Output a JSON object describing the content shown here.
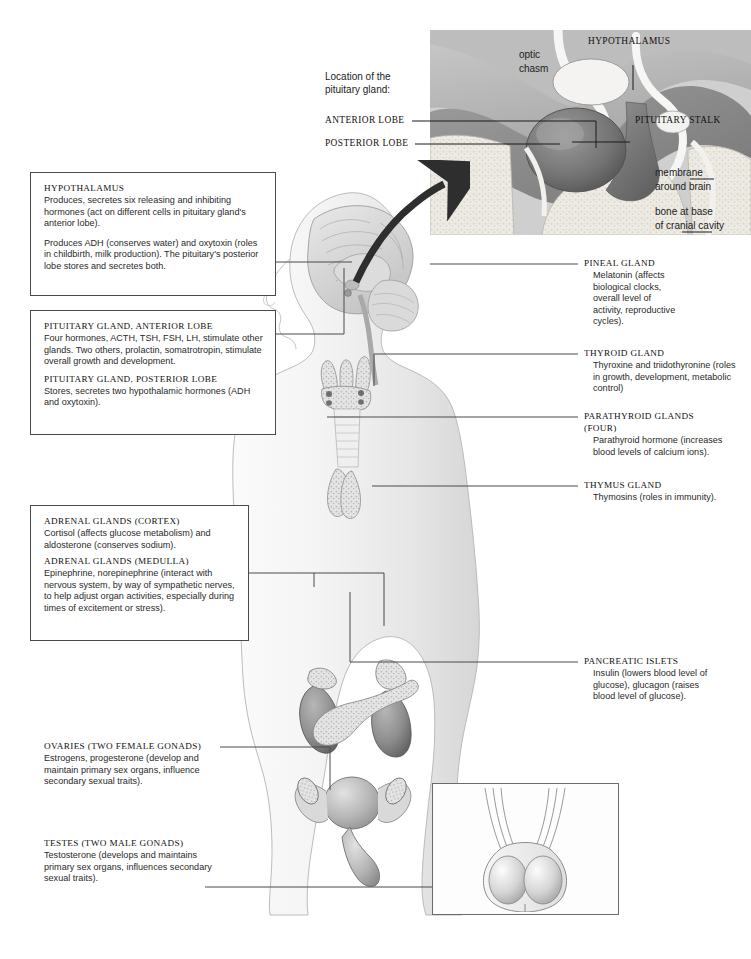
{
  "figure": {
    "background": "#ffffff",
    "line_color": "#4a4a4a"
  },
  "inset_pituitary": {
    "intro": "Location of the",
    "intro2": "pituitary gland:",
    "labels": {
      "anterior_lobe": "ANTERIOR LOBE",
      "posterior_lobe": "POSTERIOR LOBE",
      "hypothalamus": "HYPOTHALAMUS",
      "pituitary_stalk": "PITUITARY STALK",
      "optic_chasm_line1": "optic",
      "optic_chasm_line2": "chasm",
      "membrane_line1": "membrane",
      "membrane_line2": "around brain",
      "bone_line1": "bone at base",
      "bone_line2": "of cranial cavity"
    }
  },
  "callouts": {
    "hypothalamus": {
      "heading": "HYPOTHALAMUS",
      "para1": "Produces, secretes six releasing and inhibiting hormones (act on different cells in pituitary gland's anterior lobe).",
      "para2": "Produces ADH (conserves water) and oxytoxin (roles in childbirth, milk production). The pituitary's posterior lobe stores and secretes both."
    },
    "pituitary": {
      "heading_anterior": "PITUITARY GLAND, ANTERIOR LOBE",
      "para_anterior": "Four hormones, ACTH, TSH, FSH, LH, stimulate other glands. Two others, prolactin, somatrotropin, stimulate overall growth and development.",
      "heading_posterior": "PITUITARY GLAND, POSTERIOR LOBE",
      "para_posterior": "Stores, secretes two hypothalamic hormones (ADH and oxytoxin)."
    },
    "adrenal": {
      "heading_cortex": "ADRENAL GLANDS (CORTEX)",
      "para_cortex": "Cortisol (affects glucose metabolism) and aldosterone (conserves sodium).",
      "heading_medulla": "ADRENAL GLANDS (MEDULLA)",
      "para_medulla": "Epinephrine, norepinephrine (interact with nervous system, by way of sympathetic nerves, to help adjust organ activities, especially during times of excitement or stress)."
    },
    "ovaries": {
      "heading": "OVARIES (TWO FEMALE GONADS)",
      "para": "Estrogens, progesterone (develop and maintain primary sex organs, influence secondary sexual traits)."
    },
    "testes": {
      "heading": "TESTES (TWO MALE GONADS)",
      "para": "Testosterone (develops and maintains primary sex organs, influences secondary sexual traits)."
    },
    "pineal": {
      "heading": "PINEAL GLAND",
      "para": "Melatonin (affects biological clocks, overall level of activity, reproductive cycles)."
    },
    "thyroid": {
      "heading": "THYROID GLAND",
      "para": "Thyroxine and triidothyronine (roles in growth, development, metabolic control)"
    },
    "parathyroid": {
      "heading": "PARATHYROID GLANDS",
      "heading2": "(FOUR)",
      "para": "Parathyroid hormone (increases blood levels of calcium ions)."
    },
    "thymus": {
      "heading": "THYMUS GLAND",
      "para": "Thymosins (roles in immunity)."
    },
    "pancreas": {
      "heading": "PANCREATIC ISLETS",
      "para": "Insulin (lowers blood level of glucose), glucagon (raises blood level of glucose)."
    }
  }
}
